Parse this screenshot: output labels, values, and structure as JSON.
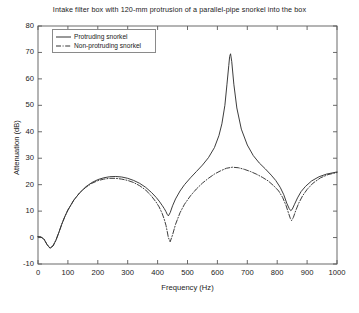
{
  "chart_data": {
    "type": "line",
    "title": "Intake filter box with 120-mm protrusion of a parallel-pipe snorkel into the box",
    "xlabel": "Frequency (Hz)",
    "ylabel": "Attenuation (dB)",
    "xlim": [
      0,
      1000
    ],
    "ylim": [
      -10,
      80
    ],
    "xticks": [
      0,
      100,
      200,
      300,
      400,
      500,
      600,
      700,
      800,
      900,
      1000
    ],
    "yticks": [
      -10,
      0,
      10,
      20,
      30,
      40,
      50,
      60,
      70,
      80
    ],
    "grid": false,
    "legend_position": "upper-left",
    "series": [
      {
        "name": "Protruding snorkel",
        "style": "solid",
        "color": "#333333",
        "x": [
          0,
          10,
          20,
          30,
          40,
          50,
          60,
          70,
          80,
          90,
          100,
          120,
          140,
          160,
          180,
          200,
          220,
          240,
          260,
          280,
          300,
          320,
          340,
          360,
          380,
          395,
          405,
          415,
          422,
          428,
          432,
          436,
          442,
          450,
          460,
          475,
          490,
          510,
          530,
          550,
          570,
          590,
          605,
          615,
          625,
          632,
          638,
          641,
          644,
          648,
          655,
          665,
          680,
          700,
          720,
          740,
          760,
          780,
          795,
          810,
          822,
          832,
          840,
          845,
          850,
          858,
          868,
          880,
          895,
          915,
          940,
          965,
          1000
        ],
        "y": [
          0.3,
          0.2,
          -0.6,
          -2.6,
          -4.0,
          -3.2,
          -1.0,
          2.0,
          5.2,
          8.0,
          10.4,
          14.2,
          17.0,
          19.2,
          20.8,
          21.9,
          22.6,
          23.0,
          23.1,
          22.9,
          22.4,
          21.6,
          20.5,
          19.0,
          17.0,
          15.2,
          13.8,
          12.2,
          11.0,
          9.8,
          8.8,
          8.2,
          9.4,
          12.0,
          14.6,
          17.6,
          20.0,
          22.6,
          25.0,
          27.4,
          30.2,
          34.0,
          38.5,
          43.0,
          50.0,
          58.0,
          65.0,
          68.5,
          69.5,
          66.5,
          58.0,
          49.0,
          41.0,
          35.0,
          31.0,
          28.2,
          26.0,
          23.6,
          21.6,
          19.0,
          16.2,
          13.0,
          11.0,
          10.2,
          10.6,
          12.6,
          15.0,
          17.4,
          19.4,
          21.4,
          23.0,
          24.0,
          24.8
        ]
      },
      {
        "name": "Non-protruding snorkel",
        "style": "dash-dot",
        "color": "#333333",
        "x": [
          0,
          10,
          20,
          30,
          40,
          50,
          60,
          70,
          80,
          90,
          100,
          120,
          140,
          160,
          180,
          200,
          220,
          240,
          260,
          280,
          300,
          320,
          340,
          360,
          380,
          395,
          405,
          415,
          422,
          428,
          432,
          436,
          442,
          450,
          460,
          475,
          490,
          510,
          530,
          550,
          570,
          590,
          610,
          630,
          650,
          670,
          690,
          710,
          730,
          750,
          770,
          790,
          805,
          818,
          830,
          838,
          844,
          848,
          854,
          862,
          872,
          885,
          900,
          920,
          945,
          970,
          1000
        ],
        "y": [
          0.3,
          0.2,
          -0.6,
          -2.6,
          -4.0,
          -3.2,
          -1.0,
          2.0,
          5.2,
          8.0,
          10.4,
          14.2,
          17.0,
          19.0,
          20.5,
          21.5,
          22.1,
          22.4,
          22.4,
          22.1,
          21.6,
          20.8,
          19.6,
          18.0,
          15.6,
          13.4,
          11.6,
          9.2,
          7.0,
          4.6,
          2.4,
          0.0,
          -1.6,
          1.0,
          5.0,
          9.4,
          12.6,
          15.8,
          18.4,
          20.6,
          22.4,
          24.0,
          25.2,
          26.2,
          26.6,
          26.4,
          25.8,
          25.0,
          24.0,
          22.8,
          21.4,
          19.4,
          17.6,
          15.2,
          12.0,
          9.2,
          7.2,
          6.4,
          7.6,
          10.2,
          13.0,
          15.8,
          18.2,
          20.6,
          22.6,
          23.8,
          24.6
        ]
      }
    ]
  }
}
